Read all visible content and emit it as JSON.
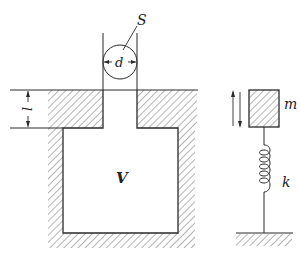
{
  "diagram": {
    "type": "mechanical-schematic",
    "colors": {
      "ink": "#2a2a2a",
      "hatch": "#6a6a6a",
      "background": "#ffffff"
    },
    "resonator": {
      "neck_area_label": "S",
      "neck_diameter_label": "d",
      "neck_length_label": "l",
      "cavity_volume_label": "V"
    },
    "oscillator": {
      "mass_label": "m",
      "spring_label": "k"
    }
  }
}
